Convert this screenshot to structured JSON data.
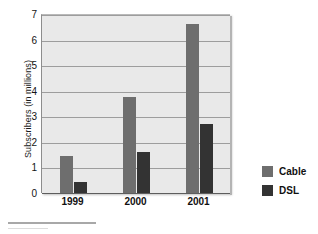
{
  "chart_data": {
    "type": "bar",
    "title": "",
    "subtitle": "",
    "xlabel": "",
    "ylabel": "Subscribers (in millions)",
    "categories": [
      "1999",
      "2000",
      "2001"
    ],
    "series": [
      {
        "name": "Cable",
        "color": "#6e6e6e",
        "values": [
          1.45,
          3.75,
          6.6
        ]
      },
      {
        "name": "DSL",
        "color": "#333333",
        "values": [
          0.45,
          1.6,
          2.7
        ]
      }
    ],
    "ylim": [
      0,
      7
    ],
    "yticks": [
      0,
      1,
      2,
      3,
      4,
      5,
      6,
      7
    ],
    "ytick_labels": [
      "0",
      "1",
      "2",
      "3",
      "4",
      "5",
      "6",
      "7"
    ],
    "grid": true,
    "grid_axis": "y",
    "legend_position": "right",
    "plot_background": "#e9e9e9",
    "figure_background": "#ffffff"
  },
  "legend": {
    "entries": [
      {
        "label": "Cable",
        "color": "#6e6e6e"
      },
      {
        "label": "DSL",
        "color": "#333333"
      }
    ]
  },
  "axes": {
    "y_title": "Subscribers (in millions)"
  }
}
